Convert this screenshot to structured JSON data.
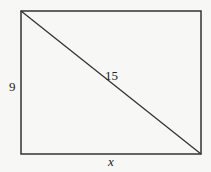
{
  "diagram": {
    "shape": "rectangle with diagonal",
    "rect": {
      "x": 21,
      "y": 11,
      "width": 180,
      "height": 143
    },
    "labels": {
      "left_side": "9",
      "diagonal": "15",
      "bottom_side": "x"
    },
    "colors": {
      "stroke": "#333333",
      "background": "#f7f7f5"
    }
  }
}
